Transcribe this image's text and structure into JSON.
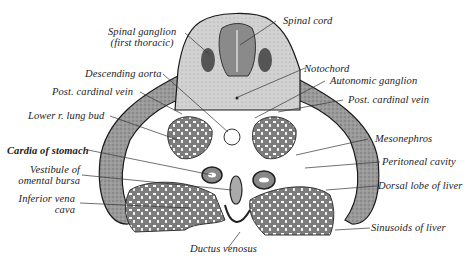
{
  "figure": {
    "colors": {
      "background": "#ffffff",
      "tissue_dark": "#7a7a7a",
      "tissue_mid": "#a8a8a8",
      "tissue_light": "#d4d4d4",
      "outline": "#1a1a1a",
      "label_text": "#222222"
    },
    "labels": {
      "spinal_ganglion_1": "Spinal ganglion",
      "spinal_ganglion_2": "(first thoracic)",
      "spinal_cord": "Spinal cord",
      "notochord": "Notochord",
      "descending_aorta": "Descending aorta",
      "autonomic_ganglion": "Autonomic ganglion",
      "post_cardinal_vein_left": "Post. cardinal vein",
      "post_cardinal_vein_right": "Post. cardinal vein",
      "lower_lung_bud": "Lower r. lung bud",
      "mesonephros": "Mesonephros",
      "cardia_of_stomach": "Cardia of stomach",
      "peritoneal_cavity": "Peritoneal cavity",
      "vestibule_1": "Vestibule of",
      "vestibule_2": "omental bursa",
      "dorsal_lobe_liver": "Dorsal lobe of liver",
      "inferior_vena_cava_1": "Inferior vena",
      "inferior_vena_cava_2": "cava",
      "sinusoids_of_liver": "Sinusoids of liver",
      "ductus_venosus": "Ductus venosus"
    }
  }
}
